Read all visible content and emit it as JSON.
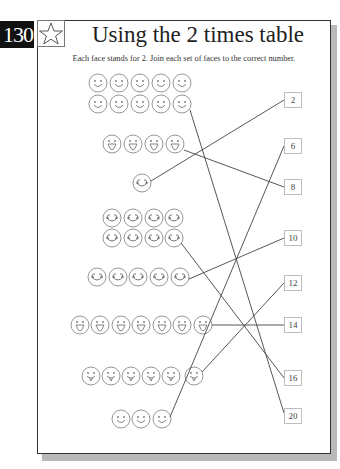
{
  "page": {
    "number": "130",
    "title": "Using the 2 times table",
    "instructions": "Each face stands for 2. Join each set of faces to the correct number.",
    "icon": "star-icon"
  },
  "face_groups": [
    {
      "id": "group-10",
      "faces": 10,
      "layout": "2 rows of 5",
      "expression": "smile",
      "joined_to": "20"
    },
    {
      "id": "group-4",
      "faces": 4,
      "layout": "1 row of 4",
      "expression": "open-mouth",
      "joined_to": "8"
    },
    {
      "id": "group-1",
      "faces": 1,
      "layout": "single",
      "expression": "wide-smile",
      "joined_to": "2"
    },
    {
      "id": "group-8",
      "faces": 8,
      "layout": "2 rows of 4",
      "expression": "wide-smile",
      "joined_to": "16"
    },
    {
      "id": "group-5",
      "faces": 5,
      "layout": "1 row of 5",
      "expression": "wide-smile",
      "joined_to": "10"
    },
    {
      "id": "group-7",
      "faces": 7,
      "layout": "1 row of 7",
      "expression": "open-mouth",
      "joined_to": "14"
    },
    {
      "id": "group-6",
      "faces": 6,
      "layout": "1 row of 6",
      "expression": "tongue",
      "joined_to": "12"
    },
    {
      "id": "group-3",
      "faces": 3,
      "layout": "1 row of 3",
      "expression": "smile",
      "joined_to": "6"
    }
  ],
  "number_boxes": [
    "2",
    "6",
    "8",
    "10",
    "12",
    "14",
    "16",
    "20"
  ],
  "colors": {
    "page_number_bg": "#111111",
    "line": "#444444",
    "face_outline": "#8a8a8a",
    "shadow": "#b9b9b9"
  }
}
